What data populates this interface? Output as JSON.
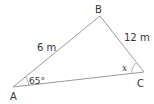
{
  "diagram": {
    "vertices": {
      "A": {
        "label": "A"
      },
      "B": {
        "label": "B"
      },
      "C": {
        "label": "C"
      }
    },
    "sides": {
      "AB": "6 m",
      "BC": "12 m"
    },
    "angles": {
      "A": "65°",
      "C": "x"
    },
    "colors": {
      "line": "#999999",
      "text": "#333333"
    }
  }
}
